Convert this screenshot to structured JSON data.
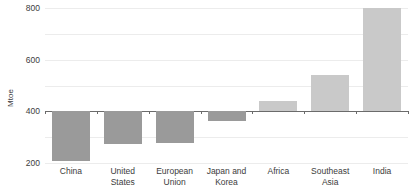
{
  "chart_data": {
    "type": "bar",
    "title": "",
    "xlabel": "",
    "ylabel": "Mtoe",
    "categories": [
      "China",
      "United States",
      "European Union",
      "Japan and Korea",
      "Africa",
      "Southeast Asia",
      "India"
    ],
    "category_lines": [
      [
        "China"
      ],
      [
        "United",
        "States"
      ],
      [
        "European",
        "Union"
      ],
      [
        "Japan and",
        "Korea"
      ],
      [
        "Africa"
      ],
      [
        "Southeast",
        "Asia"
      ],
      [
        "India"
      ]
    ],
    "values": [
      -385,
      -250,
      -245,
      -75,
      80,
      285,
      800
    ],
    "ylim": [
      -400,
      800
    ],
    "yticks": [
      800,
      600,
      400,
      200,
      0,
      -200,
      -400
    ],
    "ytick_labels": [
      "800",
      "600",
      "400",
      "200",
      "0",
      "-200",
      "-400"
    ],
    "grid": true,
    "legend": "none",
    "colors": {
      "positive_bar": "#c9c9c9",
      "negative_bar": "#9a9a9a",
      "gridline": "#ececec",
      "zero_axis": "#6b6b6b",
      "text": "#3c3c3c",
      "background": "#ffffff"
    }
  }
}
